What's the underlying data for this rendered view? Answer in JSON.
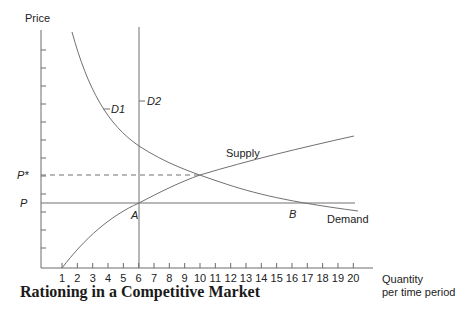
{
  "chart_data": {
    "type": "line",
    "title": "Rationing in a Competitive Market",
    "xlabel": "Quantity per time period",
    "xlabel_lines": [
      "Quantity",
      "per time period"
    ],
    "ylabel": "Price",
    "x_ticks": [
      1,
      2,
      3,
      4,
      5,
      6,
      7,
      8,
      9,
      10,
      11,
      12,
      13,
      14,
      15,
      16,
      17,
      18,
      19,
      20
    ],
    "xlim": [
      0,
      21
    ],
    "y_ticks_count": 12,
    "y_tick_labels": [
      {
        "label": "P*",
        "italic": true,
        "description": "market-clearing price"
      },
      {
        "label": "P",
        "italic": true,
        "description": "price ceiling / rationed price"
      }
    ],
    "series": [
      {
        "name": "D1",
        "kind": "demand curve (downward sloping)",
        "points": [
          [
            1.7,
            "top"
          ],
          [
            6,
            "above P*"
          ],
          [
            10,
            "P*"
          ],
          [
            16,
            "P"
          ],
          [
            20.4,
            "below P"
          ]
        ]
      },
      {
        "name": "D2",
        "kind": "vertical rationed demand",
        "x": 6
      },
      {
        "name": "Supply",
        "kind": "upward sloping",
        "points": [
          [
            1,
            0
          ],
          [
            6,
            "P"
          ],
          [
            10,
            "P*"
          ],
          [
            20,
            "high"
          ]
        ]
      },
      {
        "name": "Demand",
        "kind": "label for D1 curve end"
      }
    ],
    "horizontal_lines": [
      {
        "name": "P*",
        "style": "dashed",
        "from_x": 0,
        "to_x": 10
      },
      {
        "name": "P",
        "style": "solid",
        "from_x": 0,
        "to_x": 20
      }
    ],
    "points": [
      {
        "label": "A",
        "x": 6,
        "y": "P",
        "meaning": "Supply meets P at D2"
      },
      {
        "label": "B",
        "x": 16,
        "y": "P",
        "meaning": "Demand D1 at price P"
      },
      {
        "label": "equilibrium",
        "x": 10,
        "y": "P*"
      }
    ],
    "grid": false,
    "legend": "none (inline labels)"
  },
  "labels": {
    "y_axis": "Price",
    "x_axis_line1": "Quantity",
    "x_axis_line2": "per time period",
    "p_star": "P*",
    "p": "P",
    "d1": "D1",
    "d2": "D2",
    "supply": "Supply",
    "demand": "Demand",
    "point_a": "A",
    "point_b": "B",
    "title": "Rationing in a Competitive Market"
  },
  "colors": {
    "line": "#707070",
    "text": "#222222"
  }
}
